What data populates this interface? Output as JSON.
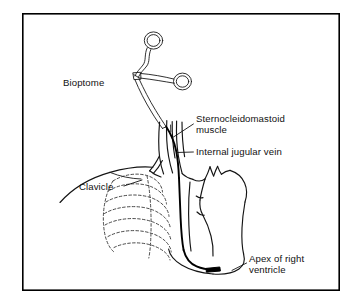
{
  "figure": {
    "background_color": "#ffffff",
    "ink_color": "#141414",
    "frame": {
      "x": 22,
      "y": 13,
      "width": 318,
      "height": 278,
      "stroke_color": "#000000"
    }
  },
  "labels": [
    {
      "id": "bioptome",
      "text": "Bioptome",
      "x": 63,
      "y": 86,
      "lines": [
        "Bioptome"
      ]
    },
    {
      "id": "sternocleidomastoid",
      "text": "Sternocleidomastoid muscle",
      "x": 196,
      "y": 122,
      "lines": [
        "Sternocleidomastoid",
        "muscle"
      ]
    },
    {
      "id": "internal-jugular-vein",
      "text": "Internal jugular vein",
      "x": 196,
      "y": 155,
      "lines": [
        "Internal jugular vein"
      ]
    },
    {
      "id": "clavicle",
      "text": "Clavicle",
      "x": 79,
      "y": 190,
      "lines": [
        "Clavicle"
      ]
    },
    {
      "id": "apex-of-right-ventricle",
      "text": "Apex of right ventricle",
      "x": 249,
      "y": 262,
      "lines": [
        "Apex of right",
        "ventricle"
      ]
    }
  ],
  "anatomy_parts": [
    "bioptome-forceps",
    "bioptome-shaft",
    "sternocleidomastoid-muscle",
    "internal-jugular-vein",
    "clavicle",
    "rib-cage",
    "aortic-arch-branches",
    "heart-outline",
    "catheter-path",
    "catheter-tip"
  ]
}
